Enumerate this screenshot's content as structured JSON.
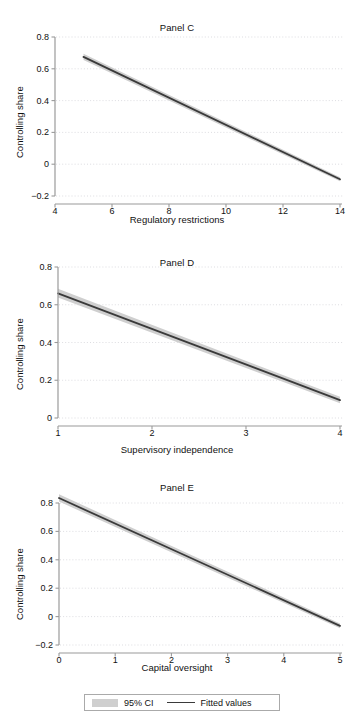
{
  "figure": {
    "ylabel": "Controlling share",
    "legend": {
      "ci_label": "95% CI",
      "fitted_label": "Fitted values",
      "ci_color": "#cfcfcf",
      "line_color": "#3a3a3a"
    }
  },
  "chart_data": [
    {
      "type": "line",
      "title": "Panel C",
      "xlabel": "Regulatory restrictions",
      "ylabel": "Controlling share",
      "xlim": [
        4,
        14
      ],
      "ylim": [
        -0.2,
        0.8
      ],
      "xticks": [
        4,
        6,
        8,
        10,
        12,
        14
      ],
      "xtick_labels": [
        "4",
        "6",
        "8",
        "10",
        "12",
        "14"
      ],
      "yticks": [
        -0.2,
        0,
        0.2,
        0.4,
        0.6,
        0.8
      ],
      "ytick_labels": [
        "−0.2",
        "0",
        "0.2",
        "0.4",
        "0.6",
        "0.8"
      ],
      "grid": "horizontal-dotted",
      "legend_position": "below-figure",
      "series": [
        {
          "name": "Fitted values",
          "x": [
            5,
            14
          ],
          "values": [
            0.675,
            -0.095
          ]
        },
        {
          "name": "95% CI upper",
          "x": [
            5,
            14
          ],
          "values": [
            0.695,
            -0.082
          ]
        },
        {
          "name": "95% CI lower",
          "x": [
            5,
            14
          ],
          "values": [
            0.655,
            -0.108
          ]
        }
      ]
    },
    {
      "type": "line",
      "title": "Panel D",
      "xlabel": "Supervisory independence",
      "ylabel": "Controlling share",
      "xlim": [
        1,
        4
      ],
      "ylim": [
        0,
        0.8
      ],
      "xticks": [
        1,
        2,
        3,
        4
      ],
      "xtick_labels": [
        "1",
        "2",
        "3",
        "4"
      ],
      "yticks": [
        0,
        0.2,
        0.4,
        0.6,
        0.8
      ],
      "ytick_labels": [
        "0",
        "0.2",
        "0.4",
        "0.6",
        "0.8"
      ],
      "grid": "horizontal-dotted",
      "legend_position": "below-figure",
      "series": [
        {
          "name": "Fitted values",
          "x": [
            1,
            4
          ],
          "values": [
            0.66,
            0.095
          ]
        },
        {
          "name": "95% CI upper",
          "x": [
            1,
            4
          ],
          "values": [
            0.685,
            0.112
          ]
        },
        {
          "name": "95% CI lower",
          "x": [
            1,
            4
          ],
          "values": [
            0.638,
            0.078
          ]
        }
      ]
    },
    {
      "type": "line",
      "title": "Panel E",
      "xlabel": "Capital oversight",
      "ylabel": "Controlling share",
      "xlim": [
        0,
        5
      ],
      "ylim": [
        -0.2,
        0.8
      ],
      "xticks": [
        0,
        1,
        2,
        3,
        4,
        5
      ],
      "xtick_labels": [
        "0",
        "1",
        "2",
        "3",
        "4",
        "5"
      ],
      "yticks": [
        -0.2,
        0,
        0.2,
        0.4,
        0.6,
        0.8
      ],
      "ytick_labels": [
        "−0.2",
        "0",
        "0.2",
        "0.4",
        "0.6",
        "0.8"
      ],
      "grid": "horizontal-dotted",
      "legend_position": "below-figure",
      "series": [
        {
          "name": "Fitted values",
          "x": [
            0,
            5
          ],
          "values": [
            0.835,
            -0.065
          ]
        },
        {
          "name": "95% CI upper",
          "x": [
            0,
            5
          ],
          "values": [
            0.862,
            -0.048
          ]
        },
        {
          "name": "95% CI lower",
          "x": [
            0,
            5
          ],
          "values": [
            0.81,
            -0.082
          ]
        }
      ]
    }
  ]
}
